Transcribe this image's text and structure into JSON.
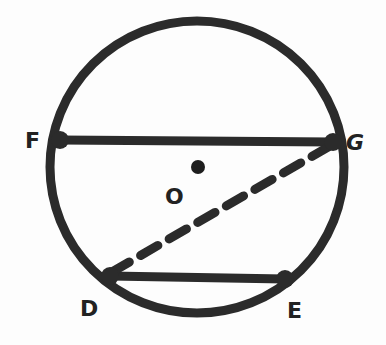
{
  "diagram": {
    "type": "circle-geometry",
    "circle": {
      "cx": 197,
      "cy": 167,
      "rx": 147,
      "ry": 146
    },
    "center": {
      "label": "O",
      "x": 197,
      "y": 167
    },
    "points": {
      "F": {
        "x": 60,
        "y": 140
      },
      "G": {
        "x": 333,
        "y": 142
      },
      "D": {
        "x": 110,
        "y": 276
      },
      "E": {
        "x": 285,
        "y": 279
      }
    },
    "segments": [
      {
        "from": "F",
        "to": "G",
        "style": "solid",
        "label": "chord FG"
      },
      {
        "from": "D",
        "to": "E",
        "style": "solid",
        "label": "chord DE"
      },
      {
        "from": "D",
        "to": "G",
        "style": "dashed",
        "label": "segment DG"
      }
    ],
    "labels": {
      "F": "F",
      "G": "G",
      "O": "O",
      "D": "D",
      "E": "E"
    },
    "colors": {
      "stroke": "#2b2b2b",
      "background": "#fdfdfd"
    }
  }
}
